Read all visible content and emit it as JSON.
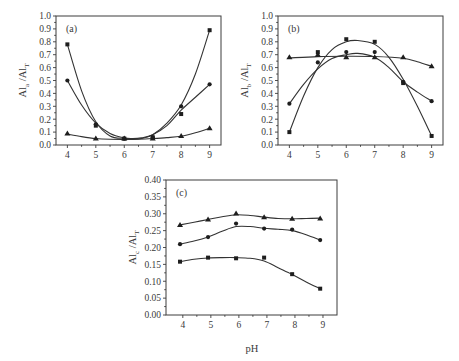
{
  "figure": {
    "xlabel_shared": "pH"
  },
  "chart_data": [
    {
      "type": "line",
      "panel_label": "(a)",
      "ylabel": "Al_a /Al_T",
      "ylabel_main": "Al",
      "ylabel_sub1": "a",
      "ylabel_mid": " /Al",
      "ylabel_sub2": "T",
      "xlabel": "",
      "x": [
        4,
        5,
        6,
        7,
        8,
        9
      ],
      "xlim": [
        3.6,
        9.4
      ],
      "ylim": [
        0.0,
        1.0
      ],
      "xticks": [
        "4",
        "5",
        "6",
        "7",
        "8",
        "9"
      ],
      "yticks": [
        "0.0",
        "0.1",
        "0.2",
        "0.3",
        "0.4",
        "0.5",
        "0.6",
        "0.7",
        "0.8",
        "0.9",
        "1.0"
      ],
      "grid": false,
      "series": [
        {
          "name": "series-square",
          "marker": "square",
          "values": [
            0.78,
            0.15,
            0.05,
            0.06,
            0.24,
            0.89
          ]
        },
        {
          "name": "series-circle",
          "marker": "circle",
          "values": [
            0.5,
            0.16,
            0.05,
            0.06,
            0.3,
            0.47
          ]
        },
        {
          "name": "series-triangle",
          "marker": "triangle",
          "values": [
            0.09,
            0.05,
            0.05,
            0.05,
            0.07,
            0.13
          ]
        }
      ],
      "fits": [
        [
          [
            4,
            0.78
          ],
          [
            4.5,
            0.42
          ],
          [
            5,
            0.18
          ],
          [
            5.5,
            0.07
          ],
          [
            6,
            0.05
          ],
          [
            6.3,
            0.045
          ],
          [
            6.6,
            0.05
          ],
          [
            7,
            0.08
          ],
          [
            7.5,
            0.17
          ],
          [
            8,
            0.31
          ],
          [
            8.5,
            0.55
          ],
          [
            9,
            0.89
          ]
        ],
        [
          [
            4,
            0.5
          ],
          [
            4.5,
            0.31
          ],
          [
            5,
            0.17
          ],
          [
            5.5,
            0.09
          ],
          [
            6,
            0.055
          ],
          [
            6.3,
            0.05
          ],
          [
            6.6,
            0.055
          ],
          [
            7,
            0.08
          ],
          [
            7.5,
            0.15
          ],
          [
            8,
            0.27
          ],
          [
            8.5,
            0.37
          ],
          [
            9,
            0.47
          ]
        ],
        [
          [
            4,
            0.085
          ],
          [
            4.5,
            0.065
          ],
          [
            5,
            0.05
          ],
          [
            5.5,
            0.044
          ],
          [
            6,
            0.043
          ],
          [
            6.5,
            0.045
          ],
          [
            7,
            0.05
          ],
          [
            7.5,
            0.057
          ],
          [
            8,
            0.068
          ],
          [
            8.5,
            0.095
          ],
          [
            9,
            0.13
          ]
        ]
      ],
      "layout": {
        "left": 56,
        "top": 16,
        "right": 221,
        "bottom": 145
      }
    },
    {
      "type": "line",
      "panel_label": "(b)",
      "ylabel": "Al_b /Al_T",
      "ylabel_main": "Al",
      "ylabel_sub1": "b",
      "ylabel_mid": " /Al",
      "ylabel_sub2": "T",
      "xlabel": "",
      "x": [
        4,
        5,
        6,
        7,
        8,
        9
      ],
      "xlim": [
        3.6,
        9.4
      ],
      "ylim": [
        0.0,
        1.0
      ],
      "xticks": [
        "4",
        "5",
        "6",
        "7",
        "8",
        "9"
      ],
      "yticks": [
        "0.0",
        "0.1",
        "0.2",
        "0.3",
        "0.4",
        "0.5",
        "0.6",
        "0.7",
        "0.8",
        "0.9",
        "1.0"
      ],
      "grid": false,
      "series": [
        {
          "name": "series-square",
          "marker": "square",
          "values": [
            0.1,
            0.72,
            0.82,
            0.8,
            0.48,
            0.07
          ]
        },
        {
          "name": "series-circle",
          "marker": "circle",
          "values": [
            0.32,
            0.64,
            0.72,
            0.72,
            0.49,
            0.34
          ]
        },
        {
          "name": "series-triangle",
          "marker": "triangle",
          "values": [
            0.68,
            0.7,
            0.68,
            0.68,
            0.68,
            0.61
          ]
        }
      ],
      "fits": [
        [
          [
            4,
            0.1
          ],
          [
            4.5,
            0.38
          ],
          [
            5,
            0.6
          ],
          [
            5.5,
            0.74
          ],
          [
            6,
            0.8
          ],
          [
            6.4,
            0.81
          ],
          [
            7,
            0.78
          ],
          [
            7.5,
            0.68
          ],
          [
            8,
            0.51
          ],
          [
            8.5,
            0.3
          ],
          [
            9,
            0.07
          ]
        ],
        [
          [
            4,
            0.32
          ],
          [
            4.5,
            0.47
          ],
          [
            5,
            0.59
          ],
          [
            5.5,
            0.67
          ],
          [
            6,
            0.7
          ],
          [
            6.4,
            0.71
          ],
          [
            7,
            0.68
          ],
          [
            7.5,
            0.6
          ],
          [
            8,
            0.49
          ],
          [
            8.5,
            0.41
          ],
          [
            9,
            0.34
          ]
        ],
        [
          [
            4,
            0.675
          ],
          [
            5,
            0.685
          ],
          [
            6,
            0.688
          ],
          [
            7,
            0.686
          ],
          [
            8,
            0.672
          ],
          [
            8.5,
            0.645
          ],
          [
            9,
            0.61
          ]
        ]
      ],
      "layout": {
        "left": 278,
        "top": 16,
        "right": 443,
        "bottom": 145
      }
    },
    {
      "type": "line",
      "panel_label": "(c)",
      "ylabel": "Al_c /Al_T",
      "ylabel_main": "Al",
      "ylabel_sub1": "c",
      "ylabel_mid": " /Al",
      "ylabel_sub2": "T",
      "xlabel": "pH",
      "x": [
        3.9,
        4.9,
        5.9,
        6.9,
        7.9,
        8.9
      ],
      "xlim": [
        3.4,
        9.5
      ],
      "ylim": [
        0.0,
        0.4
      ],
      "xticks": [
        "4",
        "5",
        "6",
        "7",
        "8",
        "9"
      ],
      "xtick_values": [
        4,
        5,
        6,
        7,
        8,
        9
      ],
      "yticks": [
        "0.00",
        "0.05",
        "0.10",
        "0.15",
        "0.20",
        "0.25",
        "0.30",
        "0.35",
        "0.40"
      ],
      "grid": false,
      "series": [
        {
          "name": "series-square",
          "marker": "square",
          "values": [
            0.158,
            0.17,
            0.168,
            0.17,
            0.121,
            0.078
          ]
        },
        {
          "name": "series-circle",
          "marker": "circle",
          "values": [
            0.21,
            0.231,
            0.271,
            0.256,
            0.253,
            0.222
          ]
        },
        {
          "name": "series-triangle",
          "marker": "triangle",
          "values": [
            0.267,
            0.283,
            0.301,
            0.29,
            0.285,
            0.286
          ]
        }
      ],
      "fits": [
        [
          [
            3.9,
            0.158
          ],
          [
            4.4,
            0.165
          ],
          [
            4.9,
            0.169
          ],
          [
            5.4,
            0.17
          ],
          [
            5.9,
            0.17
          ],
          [
            6.4,
            0.168
          ],
          [
            6.9,
            0.16
          ],
          [
            7.4,
            0.14
          ],
          [
            7.9,
            0.12
          ],
          [
            8.4,
            0.098
          ],
          [
            8.9,
            0.078
          ]
        ],
        [
          [
            3.9,
            0.21
          ],
          [
            4.4,
            0.219
          ],
          [
            4.9,
            0.231
          ],
          [
            5.4,
            0.248
          ],
          [
            5.9,
            0.262
          ],
          [
            6.4,
            0.262
          ],
          [
            6.9,
            0.257
          ],
          [
            7.4,
            0.254
          ],
          [
            7.9,
            0.25
          ],
          [
            8.4,
            0.238
          ],
          [
            8.9,
            0.222
          ]
        ],
        [
          [
            3.9,
            0.267
          ],
          [
            4.4,
            0.275
          ],
          [
            4.9,
            0.283
          ],
          [
            5.4,
            0.291
          ],
          [
            5.9,
            0.297
          ],
          [
            6.4,
            0.295
          ],
          [
            6.9,
            0.29
          ],
          [
            7.4,
            0.286
          ],
          [
            7.9,
            0.285
          ],
          [
            8.4,
            0.286
          ],
          [
            8.9,
            0.287
          ]
        ]
      ],
      "layout": {
        "left": 166,
        "top": 180,
        "right": 337,
        "bottom": 315
      }
    }
  ]
}
